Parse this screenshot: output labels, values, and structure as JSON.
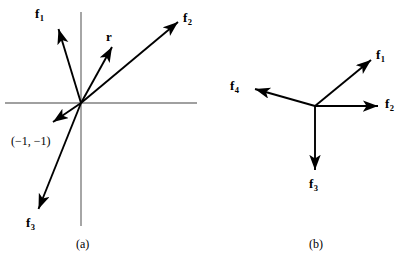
{
  "figure": {
    "background_color": "#ffffff",
    "ink_color": "#000000",
    "axis_color": "#808080",
    "width": 409,
    "height": 261,
    "panels": [
      {
        "id": "a",
        "caption": "(a)",
        "caption_pos": {
          "x": 76,
          "y": 237
        },
        "origin": {
          "x": 81,
          "y": 103
        },
        "axes": {
          "x_axis": {
            "x1": 5,
            "y1": 103,
            "x2": 197,
            "y2": 103
          },
          "y_axis": {
            "x1": 81,
            "y1": 12,
            "x2": 81,
            "y2": 226
          }
        },
        "vectors": [
          {
            "name": "f1",
            "label": "f",
            "sub": "1",
            "tip": {
              "x": 57,
              "y": 27
            },
            "label_pos": {
              "x": 35,
              "y": 7
            }
          },
          {
            "name": "f2",
            "label": "f",
            "sub": "2",
            "tip": {
              "x": 180,
              "y": 20
            },
            "label_pos": {
              "x": 183,
              "y": 11
            }
          },
          {
            "name": "r",
            "label": "r",
            "sub": "",
            "tip": {
              "x": 113,
              "y": 45
            },
            "label_pos": {
              "x": 106,
              "y": 30
            }
          },
          {
            "name": "f3",
            "label": "f",
            "sub": "3",
            "tip": {
              "x": 37,
              "y": 212
            },
            "label_pos": {
              "x": 26,
              "y": 216
            }
          },
          {
            "name": "point-neg1-neg1",
            "label": "",
            "sub": "",
            "tip": {
              "x": 51,
              "y": 124
            },
            "label_pos": {
              "x": 0,
              "y": 0
            }
          }
        ],
        "point_label": {
          "text": "(−1, −1)",
          "pos": {
            "x": 11,
            "y": 134
          }
        }
      },
      {
        "id": "b",
        "caption": "(b)",
        "caption_pos": {
          "x": 309,
          "y": 237
        },
        "origin": {
          "x": 315,
          "y": 106
        },
        "axes": null,
        "vectors": [
          {
            "name": "f1",
            "label": "f",
            "sub": "1",
            "tip": {
              "x": 373,
              "y": 58
            },
            "label_pos": {
              "x": 376,
              "y": 48
            }
          },
          {
            "name": "f2",
            "label": "f",
            "sub": "2",
            "tip": {
              "x": 380,
              "y": 106
            },
            "label_pos": {
              "x": 385,
              "y": 97
            }
          },
          {
            "name": "f3",
            "label": "f",
            "sub": "3",
            "tip": {
              "x": 315,
              "y": 173
            },
            "label_pos": {
              "x": 309,
              "y": 177
            }
          },
          {
            "name": "f4",
            "label": "f",
            "sub": "4",
            "tip": {
              "x": 252,
              "y": 88
            },
            "label_pos": {
              "x": 230,
              "y": 79
            }
          }
        ],
        "point_label": null
      }
    ]
  }
}
